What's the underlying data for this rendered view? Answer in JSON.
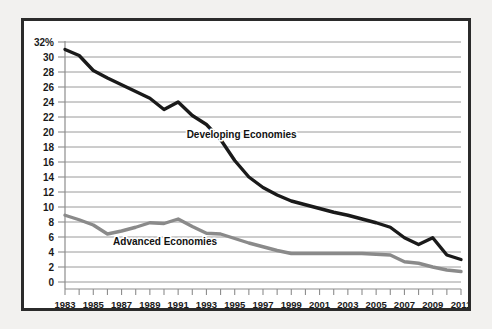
{
  "chart_data": {
    "type": "line",
    "title": "",
    "subtitle": "",
    "xlabel": "",
    "ylabel": "",
    "xlim": [
      1983,
      2011
    ],
    "ylim": [
      0,
      32
    ],
    "ytick_step": 2,
    "grid": "horizontal",
    "legend_position": "inline-annotations",
    "x": [
      1983,
      1984,
      1985,
      1986,
      1987,
      1988,
      1989,
      1990,
      1991,
      1992,
      1993,
      1994,
      1995,
      1996,
      1997,
      1998,
      1999,
      2000,
      2001,
      2002,
      2003,
      2004,
      2005,
      2006,
      2007,
      2008,
      2009,
      2010,
      2011
    ],
    "xtick_labels": [
      "1983",
      "1985",
      "1987",
      "1989",
      "1991",
      "1993",
      "1995",
      "1997",
      "1999",
      "2001",
      "2003",
      "2005",
      "2007",
      "2009",
      "2011"
    ],
    "xtick_values": [
      1983,
      1985,
      1987,
      1989,
      1991,
      1993,
      1995,
      1997,
      1999,
      2001,
      2003,
      2005,
      2007,
      2009,
      2011
    ],
    "ytick_labels": [
      "32%",
      "30",
      "28",
      "26",
      "24",
      "22",
      "20",
      "18",
      "16",
      "14",
      "12",
      "10",
      "8",
      "6",
      "4",
      "2",
      "0"
    ],
    "ytick_values": [
      32,
      30,
      28,
      26,
      24,
      22,
      20,
      18,
      16,
      14,
      12,
      10,
      8,
      6,
      4,
      2,
      0
    ],
    "series": [
      {
        "name": "Developing Economies",
        "color": "#1a1a1a",
        "stroke_width": 3.4,
        "label_x": 1991.6,
        "label_y": 19.2,
        "values": [
          31.0,
          30.2,
          28.2,
          27.2,
          26.3,
          25.4,
          24.5,
          23.0,
          24.0,
          22.2,
          21.0,
          19.0,
          16.2,
          14.0,
          12.6,
          11.6,
          10.8,
          10.3,
          9.8,
          9.3,
          8.9,
          8.4,
          7.9,
          7.3,
          5.9,
          5.0,
          5.9,
          3.6,
          3.0
        ]
      },
      {
        "name": "Advanced Economies",
        "color": "#8a8a8a",
        "stroke_width": 3.4,
        "label_x": 1986.4,
        "label_y": 5.0,
        "values": [
          8.9,
          8.3,
          7.6,
          6.4,
          6.8,
          7.3,
          7.9,
          7.8,
          8.4,
          7.4,
          6.5,
          6.4,
          5.8,
          5.2,
          4.7,
          4.2,
          3.8,
          3.8,
          3.8,
          3.8,
          3.8,
          3.8,
          3.7,
          3.6,
          2.7,
          2.5,
          2.0,
          1.6,
          1.4
        ]
      }
    ]
  }
}
